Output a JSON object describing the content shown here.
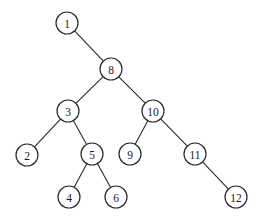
{
  "diagram": {
    "type": "binary-tree",
    "node_radius": 11,
    "colors": {
      "background": "#ffffff",
      "stroke": "#2a2a2a",
      "text": "#1a1a1a"
    },
    "nodes": [
      {
        "id": "1",
        "label": "1",
        "x": 67,
        "y": 23
      },
      {
        "id": "8",
        "label": "8",
        "x": 111,
        "y": 69
      },
      {
        "id": "3",
        "label": "3",
        "x": 68,
        "y": 111
      },
      {
        "id": "10",
        "label": "10",
        "x": 153,
        "y": 111
      },
      {
        "id": "2",
        "label": "2",
        "x": 27,
        "y": 155
      },
      {
        "id": "5",
        "label": "5",
        "x": 92,
        "y": 154
      },
      {
        "id": "9",
        "label": "9",
        "x": 130,
        "y": 154
      },
      {
        "id": "11",
        "label": "11",
        "x": 195,
        "y": 154
      },
      {
        "id": "4",
        "label": "4",
        "x": 69,
        "y": 197
      },
      {
        "id": "6",
        "label": "6",
        "x": 116,
        "y": 197
      },
      {
        "id": "12",
        "label": "12",
        "x": 236,
        "y": 197
      }
    ],
    "edges": [
      {
        "from": "1",
        "to": "8"
      },
      {
        "from": "8",
        "to": "3"
      },
      {
        "from": "8",
        "to": "10"
      },
      {
        "from": "3",
        "to": "2"
      },
      {
        "from": "3",
        "to": "5"
      },
      {
        "from": "10",
        "to": "9"
      },
      {
        "from": "10",
        "to": "11"
      },
      {
        "from": "5",
        "to": "4"
      },
      {
        "from": "5",
        "to": "6"
      },
      {
        "from": "11",
        "to": "12"
      }
    ]
  }
}
